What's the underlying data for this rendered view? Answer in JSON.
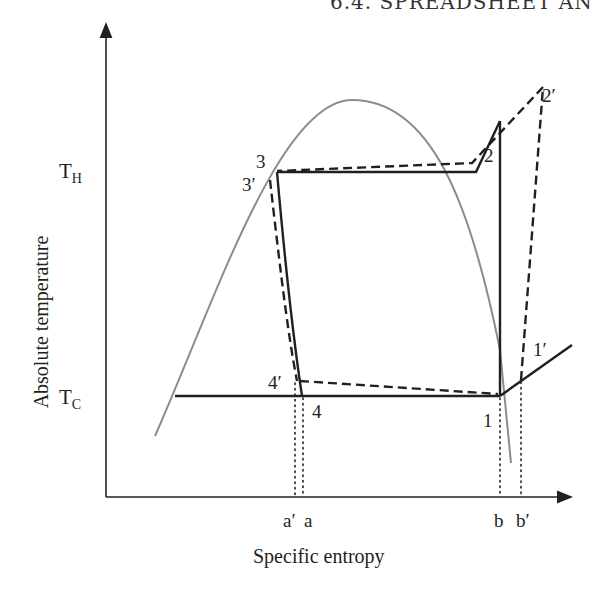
{
  "header": {
    "fragment": "6.4. SPREADSHEET AN"
  },
  "diagram": {
    "type": "T-s diagram (vapor-compression refrigeration cycle)",
    "axes": {
      "ylabel": "Absolute temperature",
      "xlabel": "Specific entropy",
      "y_ticks": [
        {
          "main": "T",
          "sub": "H"
        },
        {
          "main": "T",
          "sub": "C"
        }
      ],
      "x_ticks": [
        "a′",
        "a",
        "b",
        "b′"
      ]
    },
    "points": {
      "p1": "1",
      "p2": "2",
      "p3": "3",
      "p4": "4",
      "p1p": "1′",
      "p2p": "2′",
      "p3p": "3′",
      "p4p": "4′"
    },
    "colors": {
      "dome": "#8c8c8c",
      "cycle": "#231f20",
      "axis": "#231f20"
    },
    "legend_semantics": {
      "solid": "ideal cycle 1-2-3-4",
      "dashed": "actual cycle 1′-2′-3′-4′",
      "dotted": "entropy projections a′, a, b, b′"
    }
  }
}
